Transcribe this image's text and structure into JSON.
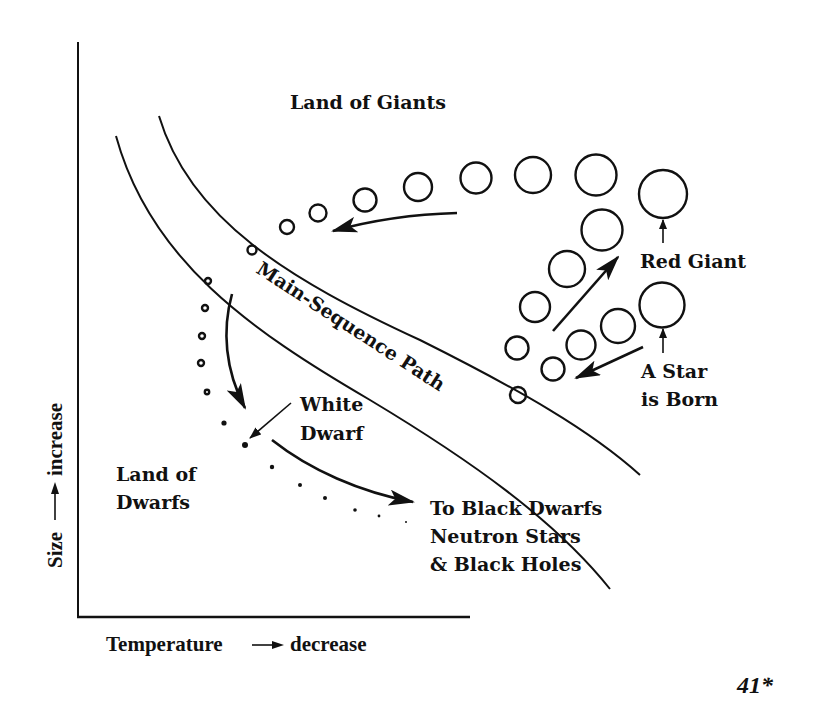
{
  "diagram": {
    "type": "stellar-evolution-size-vs-temperature",
    "axes": {
      "x_label": "Temperature → decrease",
      "x_label_left": "Temperature",
      "x_label_right": "decrease",
      "y_label": "Size —→ increase",
      "y_label_left": "Size",
      "y_label_right": "increase"
    },
    "regions": {
      "giants": "Land of Giants",
      "dwarfs_line1": "Land of",
      "dwarfs_line2": "Dwarfs"
    },
    "path_label": "Main-Sequence Path",
    "annotations": {
      "red_giant": "Red Giant",
      "star_born_line1": "A Star",
      "star_born_line2": "is Born",
      "white_dwarf_line1": "White",
      "white_dwarf_line2": "Dwarf",
      "end_line1": "To Black Dwarfs",
      "end_line2": "Neutron Stars",
      "end_line3": "& Black Holes"
    },
    "page_number": "41*",
    "colors": {
      "ink": "#111111",
      "background": "#ffffff"
    }
  }
}
